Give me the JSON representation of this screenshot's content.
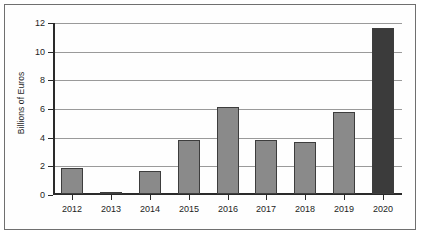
{
  "chart_data": {
    "type": "bar",
    "title": "",
    "xlabel": "",
    "ylabel": "Billions of Euros",
    "categories": [
      "2012",
      "2013",
      "2014",
      "2015",
      "2016",
      "2017",
      "2018",
      "2019",
      "2020"
    ],
    "values": [
      1.8,
      0.15,
      1.6,
      3.8,
      6.05,
      3.8,
      3.6,
      5.75,
      11.6
    ],
    "ylim": [
      0,
      12
    ],
    "yticks": [
      0,
      2,
      4,
      6,
      8,
      10,
      12
    ],
    "ytick_labels": [
      "0",
      "2",
      "4",
      "6",
      "8",
      "10",
      "12"
    ],
    "grid": true,
    "legend": false,
    "bar_colors": [
      "#8a8a8a",
      "#8a8a8a",
      "#8a8a8a",
      "#8a8a8a",
      "#8a8a8a",
      "#8a8a8a",
      "#8a8a8a",
      "#8a8a8a",
      "#3b3b3b"
    ],
    "highlight_color": "#3b3b3b",
    "default_bar_color": "#8a8a8a",
    "bar_edge_color": "#3d3d3d",
    "axis_color": "#2a2a2a",
    "gridline_color": "#9a9a9a",
    "frame_color": "#6f6f6f",
    "background_color": "#fefefe"
  }
}
